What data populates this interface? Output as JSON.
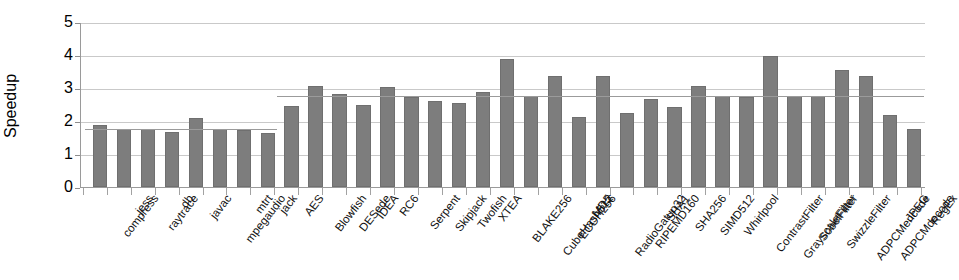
{
  "chart_data": {
    "type": "bar",
    "title": "",
    "xlabel": "",
    "ylabel": "Speedup",
    "ylim": [
      0,
      5
    ],
    "yticks": [
      0,
      1,
      2,
      3,
      4,
      5
    ],
    "grid": true,
    "legend": "none",
    "bar_color": "#7d7d7d",
    "categories": [
      "compress",
      "jess",
      "raytrace",
      "db",
      "javac",
      "mpegaudio",
      "mtrt",
      "jack",
      "AES",
      "Blowfish",
      "DESede",
      "IDEA",
      "RC6",
      "Serpent",
      "Skipjack",
      "Twofish",
      "XTEA",
      "BLAKE256",
      "CubeHash512",
      "ECOH256",
      "MD5",
      "RadioGatun32",
      "RIPEMD160",
      "SHA1",
      "SHA256",
      "SIMD512",
      "Whirlpool",
      "ContrastFilter",
      "GrayscaleFilter",
      "SobelFilter",
      "SwizzleFilter",
      "ADPCMencode",
      "ADPCMdecode",
      "JPEG",
      "RegEx"
    ],
    "values": [
      1.88,
      1.76,
      1.77,
      1.68,
      2.08,
      1.76,
      1.72,
      1.64,
      2.44,
      3.07,
      2.83,
      2.49,
      3.02,
      2.74,
      2.61,
      2.56,
      2.88,
      3.87,
      2.75,
      3.35,
      2.12,
      3.35,
      2.23,
      2.67,
      2.42,
      3.05,
      2.77,
      2.74,
      3.98,
      2.76,
      2.76,
      3.55,
      3.35,
      2.17,
      1.75
    ],
    "reference_lines": [
      {
        "name": "java-suite-average",
        "value": 1.78,
        "from_index": 0,
        "to_index": 7
      },
      {
        "name": "native-suite-average",
        "value": 2.79,
        "from_index": 8,
        "to_index": 34
      }
    ]
  }
}
